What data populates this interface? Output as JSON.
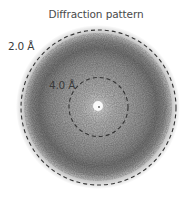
{
  "figure": {
    "title": "Diffraction pattern",
    "center": [
      98,
      107
    ],
    "rings": [
      {
        "label": "2.0 Å",
        "radius": 77
      },
      {
        "label": "4.0 Å",
        "radius": 29
      }
    ],
    "colors": {
      "ring_stroke": "#333333",
      "pattern_dark": "#6e6e6e",
      "pattern_mid": "#a8a8a8",
      "background": "#ffffff",
      "title_text": "#4a4a4a"
    }
  }
}
